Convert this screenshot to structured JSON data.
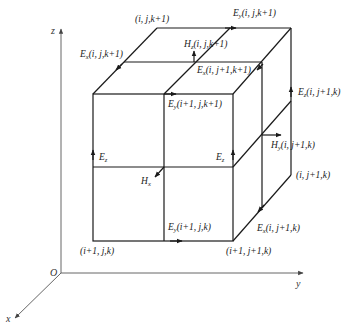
{
  "axes": {
    "z": "z",
    "y": "y",
    "x": "x",
    "origin": "O"
  },
  "nodes": {
    "top_back_left": "(i, j,k+1)",
    "front_bottom_left": "(i+1, j,k)",
    "front_bottom_right": "(i+1, j+1,k)",
    "back_right_bottom": "(i, j+1,k)"
  },
  "fields": [
    {
      "id": "ey-top-back",
      "sym": "E",
      "sub": "y",
      "idx": "(i, j,k+1)"
    },
    {
      "id": "ex-top-left",
      "sym": "E",
      "sub": "x",
      "idx": "(i, j,k+1)"
    },
    {
      "id": "hz-top",
      "sym": "H",
      "sub": "z",
      "idx": "(i, j,k+1)"
    },
    {
      "id": "ex-top-right",
      "sym": "E",
      "sub": "x",
      "idx": "(i, j+1,k+1)"
    },
    {
      "id": "ey-front-top",
      "sym": "E",
      "sub": "y",
      "idx": "(i+1, j,k+1)"
    },
    {
      "id": "ez-back-right",
      "sym": "E",
      "sub": "z",
      "idx": "(i, j+1,k)"
    },
    {
      "id": "hy-right",
      "sym": "H",
      "sub": "y",
      "idx": "(i, j+1,k)"
    },
    {
      "id": "ez-front-left",
      "sym": "E",
      "sub": "z",
      "idx": ""
    },
    {
      "id": "ez-front-right",
      "sym": "E",
      "sub": "z",
      "idx": ""
    },
    {
      "id": "hx-front",
      "sym": "H",
      "sub": "x",
      "idx": ""
    },
    {
      "id": "ey-front-bottom",
      "sym": "E",
      "sub": "y",
      "idx": "(i+1, j,k)"
    },
    {
      "id": "ex-bottom-right",
      "sym": "E",
      "sub": "x",
      "idx": "(i, j+1,k)"
    }
  ]
}
